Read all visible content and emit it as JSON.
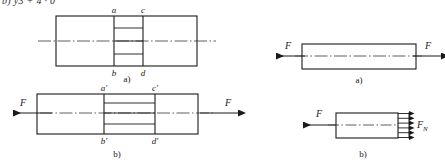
{
  "page": {
    "background_color": "#ffffff",
    "line_color": "#1a1a1a",
    "axis_color": "#4d4d4d",
    "text_color": "#1a1a1a",
    "clipped_text_top": "b) y3 + 4 · 0"
  },
  "figures": {
    "left_group": {
      "figure_a": {
        "caption": "a)",
        "vertex_labels": {
          "top_left": "a",
          "top_right": "c",
          "bottom_left": "b",
          "bottom_right": "d"
        }
      },
      "figure_b": {
        "caption": "b)",
        "vertex_labels": {
          "top_left": "a'",
          "top_right": "c'",
          "bottom_left": "b'",
          "bottom_right": "d'"
        },
        "force_left": "F",
        "force_right": "F"
      }
    },
    "right_group": {
      "figure_a": {
        "caption": "a)",
        "force_left": "F",
        "force_right": "F"
      },
      "figure_b": {
        "caption": "b)",
        "force_left": "F",
        "internal_force_label": "F",
        "internal_force_subscript": "N",
        "distributed_arrow_count": 6
      }
    }
  }
}
